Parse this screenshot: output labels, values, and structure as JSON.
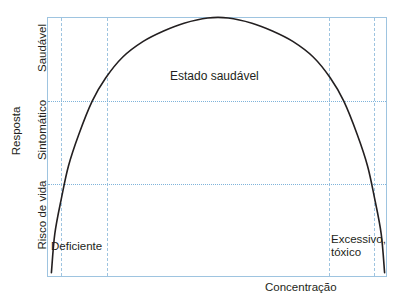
{
  "chart_data": {
    "type": "line",
    "title": "",
    "subtitle": "",
    "xlabel": "Concentração",
    "ylabel": "Resposta",
    "xlim": [
      0,
      100
    ],
    "ylim": [
      0,
      100
    ],
    "grid": true,
    "legend_position": "none",
    "x_tick_labels": [],
    "y_tick_labels": [
      "Risco de vida",
      "Sintomático",
      "Saudável"
    ],
    "y_tick_positions": [
      12,
      40,
      75
    ],
    "y_category_boundaries": [
      29,
      68
    ],
    "x_zone_boundaries": [
      4,
      17,
      83,
      96
    ],
    "series": [
      {
        "name": "Resposta fisiológica",
        "color": "#231f20",
        "x": [
          1,
          2,
          4,
          6,
          9,
          13,
          17,
          22,
          28,
          34,
          40,
          47,
          53,
          60,
          66,
          72,
          78,
          83,
          87,
          91,
          94,
          96,
          98,
          99
        ],
        "values": [
          2,
          17,
          31,
          43,
          55,
          68,
          77,
          85,
          91,
          95,
          98,
          100,
          100,
          98,
          95,
          91,
          85,
          77,
          68,
          55,
          43,
          31,
          17,
          2
        ]
      }
    ],
    "annotations": [
      {
        "text": "Estado saudável",
        "x": 50,
        "y": 80
      },
      {
        "text": "Deficiente",
        "x": 5,
        "y": 14
      },
      {
        "text": "Excessivo,\ntóxico",
        "x": 86,
        "y": 17
      }
    ],
    "colors": {
      "curve": "#231f20",
      "grid": "#9ec4e0",
      "grid_dotted": "#7fb3da",
      "axis_border": "#9ec4e0",
      "text": "#231f20",
      "background": "#ffffff"
    }
  },
  "axes": {
    "y_title": "Resposta",
    "x_title": "Concentração",
    "y_bands": [
      {
        "id": "saudavel",
        "label": "Saudável"
      },
      {
        "id": "sintomatico",
        "label": "Sintomático"
      },
      {
        "id": "risco",
        "label": "Risco de vida"
      }
    ]
  },
  "annotations": {
    "healthy_state": "Estado saudável",
    "deficient": "Deficiente",
    "excessive": "Excessivo,\ntóxico"
  }
}
